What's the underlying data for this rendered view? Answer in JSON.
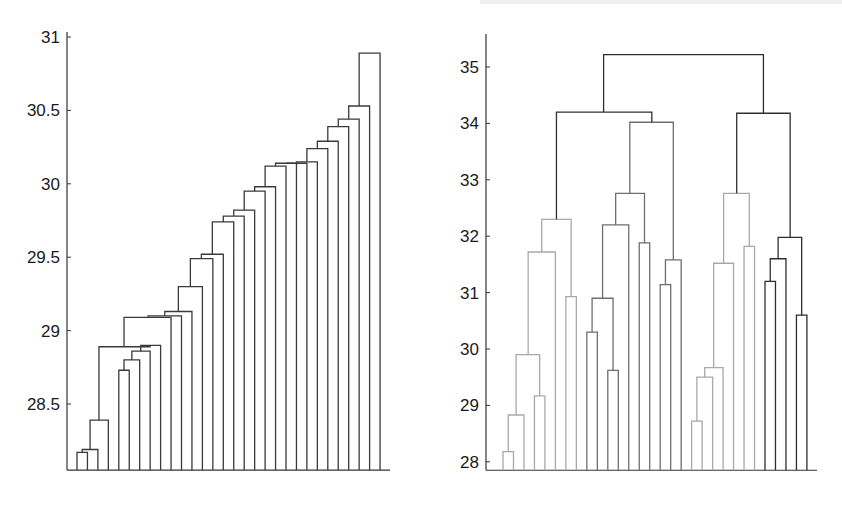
{
  "chart_data": [
    {
      "type": "dendrogram",
      "title": "",
      "xlabel": "",
      "ylabel": "",
      "ylim": [
        28.05,
        31.0
      ],
      "yticks": [
        31,
        30.5,
        30,
        29.5,
        29,
        28.5
      ],
      "ytick_labels": [
        "31",
        "30.5",
        "30",
        "29.5",
        "29",
        "28.5"
      ],
      "n_leaves": 30,
      "line_color": "#3a3a3a",
      "grid": false,
      "links": [
        {
          "x1": 0,
          "x2": 1,
          "y1": 28.05,
          "y2": 28.05,
          "h": 28.17
        },
        {
          "x1": 0.5,
          "x2": 2,
          "y1": 28.17,
          "y2": 28.05,
          "h": 28.19
        },
        {
          "x1": 1.25,
          "x2": 3,
          "y1": 28.19,
          "y2": 28.05,
          "h": 28.39
        },
        {
          "x1": 4,
          "x2": 5,
          "y1": 28.05,
          "y2": 28.05,
          "h": 28.73
        },
        {
          "x1": 4.5,
          "x2": 6,
          "y1": 28.73,
          "y2": 28.05,
          "h": 28.8
        },
        {
          "x1": 5.25,
          "x2": 7,
          "y1": 28.8,
          "y2": 28.05,
          "h": 28.86
        },
        {
          "x1": 6.1,
          "x2": 8,
          "y1": 28.86,
          "y2": 28.05,
          "h": 28.9
        },
        {
          "x1": 2.1,
          "x2": 7.0,
          "y1": 28.39,
          "y2": 28.9,
          "h": 28.89
        },
        {
          "x1": 4.5,
          "x2": 9,
          "y1": 28.89,
          "y2": 28.05,
          "h": 29.09
        },
        {
          "x1": 6.8,
          "x2": 10,
          "y1": 29.09,
          "y2": 28.05,
          "h": 29.1
        },
        {
          "x1": 8.4,
          "x2": 11,
          "y1": 29.1,
          "y2": 28.05,
          "h": 29.13
        },
        {
          "x1": 9.7,
          "x2": 12,
          "y1": 29.13,
          "y2": 28.05,
          "h": 29.3
        },
        {
          "x1": 10.85,
          "x2": 13,
          "y1": 29.3,
          "y2": 28.05,
          "h": 29.49
        },
        {
          "x1": 11.9,
          "x2": 14,
          "y1": 29.49,
          "y2": 28.05,
          "h": 29.52
        },
        {
          "x1": 12.95,
          "x2": 15,
          "y1": 29.52,
          "y2": 28.05,
          "h": 29.74
        },
        {
          "x1": 14.0,
          "x2": 16,
          "y1": 29.74,
          "y2": 28.05,
          "h": 29.78
        },
        {
          "x1": 15.0,
          "x2": 17,
          "y1": 29.78,
          "y2": 28.05,
          "h": 29.82
        },
        {
          "x1": 16.0,
          "x2": 18,
          "y1": 29.82,
          "y2": 28.05,
          "h": 29.95
        },
        {
          "x1": 17.0,
          "x2": 19,
          "y1": 29.95,
          "y2": 28.05,
          "h": 29.98
        },
        {
          "x1": 18.0,
          "x2": 20,
          "y1": 29.98,
          "y2": 28.05,
          "h": 30.12
        },
        {
          "x1": 19.0,
          "x2": 21,
          "y1": 30.12,
          "y2": 28.05,
          "h": 30.14
        },
        {
          "x1": 20.0,
          "x2": 22,
          "y1": 30.14,
          "y2": 28.05,
          "h": 30.14
        },
        {
          "x1": 21.0,
          "x2": 23,
          "y1": 30.14,
          "y2": 28.05,
          "h": 30.15
        },
        {
          "x1": 22.0,
          "x2": 24,
          "y1": 30.15,
          "y2": 28.05,
          "h": 30.24
        },
        {
          "x1": 23.0,
          "x2": 25,
          "y1": 30.24,
          "y2": 28.05,
          "h": 30.29
        },
        {
          "x1": 24.0,
          "x2": 26,
          "y1": 30.29,
          "y2": 28.05,
          "h": 30.39
        },
        {
          "x1": 25.0,
          "x2": 27,
          "y1": 30.39,
          "y2": 28.05,
          "h": 30.44
        },
        {
          "x1": 26.0,
          "x2": 28,
          "y1": 30.44,
          "y2": 28.05,
          "h": 30.53
        },
        {
          "x1": 27.0,
          "x2": 29,
          "y1": 30.53,
          "y2": 28.05,
          "h": 30.89
        }
      ]
    },
    {
      "type": "dendrogram",
      "title": "",
      "xlabel": "",
      "ylabel": "",
      "ylim": [
        27.85,
        35.55
      ],
      "yticks": [
        35,
        34,
        33,
        32,
        31,
        30,
        29,
        28
      ],
      "ytick_labels": [
        "35",
        "34",
        "33",
        "32",
        "31",
        "30",
        "29",
        "28"
      ],
      "n_leaves": 30,
      "grid": false,
      "colors": {
        "dark": "#2e2e2e",
        "mid": "#6e6e6e",
        "light": "#a8a8a8"
      },
      "links": [
        {
          "x1": 0,
          "x2": 1,
          "y1": 27.85,
          "y2": 27.85,
          "h": 28.18,
          "c": "light"
        },
        {
          "x1": 0.5,
          "x2": 2,
          "y1": 28.18,
          "y2": 27.85,
          "h": 28.83,
          "c": "light"
        },
        {
          "x1": 3,
          "x2": 4,
          "y1": 27.85,
          "y2": 27.85,
          "h": 29.17,
          "c": "light"
        },
        {
          "x1": 1.25,
          "x2": 3.5,
          "y1": 28.83,
          "y2": 29.17,
          "h": 29.9,
          "c": "light"
        },
        {
          "x1": 2.4,
          "x2": 5,
          "y1": 29.9,
          "y2": 27.85,
          "h": 31.72,
          "c": "light"
        },
        {
          "x1": 6,
          "x2": 7,
          "y1": 27.85,
          "y2": 27.85,
          "h": 30.93,
          "c": "light"
        },
        {
          "x1": 3.7,
          "x2": 6.5,
          "y1": 31.72,
          "y2": 30.93,
          "h": 32.3,
          "c": "light"
        },
        {
          "x1": 8,
          "x2": 9,
          "y1": 27.85,
          "y2": 27.85,
          "h": 30.3,
          "c": "mid"
        },
        {
          "x1": 10,
          "x2": 11,
          "y1": 27.85,
          "y2": 27.85,
          "h": 29.62,
          "c": "mid"
        },
        {
          "x1": 8.5,
          "x2": 10.5,
          "y1": 30.3,
          "y2": 29.62,
          "h": 30.9,
          "c": "mid"
        },
        {
          "x1": 9.5,
          "x2": 12,
          "y1": 30.9,
          "y2": 27.85,
          "h": 32.2,
          "c": "mid"
        },
        {
          "x1": 13,
          "x2": 14,
          "y1": 27.85,
          "y2": 27.85,
          "h": 31.88,
          "c": "mid"
        },
        {
          "x1": 10.75,
          "x2": 13.5,
          "y1": 32.2,
          "y2": 31.88,
          "h": 32.76,
          "c": "mid"
        },
        {
          "x1": 15,
          "x2": 16,
          "y1": 27.85,
          "y2": 27.85,
          "h": 31.14,
          "c": "mid"
        },
        {
          "x1": 15.5,
          "x2": 17,
          "y1": 31.14,
          "y2": 27.85,
          "h": 31.58,
          "c": "mid"
        },
        {
          "x1": 12.1,
          "x2": 16.25,
          "y1": 32.76,
          "y2": 31.58,
          "h": 34.02,
          "c": "mid"
        },
        {
          "x1": 5.1,
          "x2": 14.2,
          "y1": 32.3,
          "y2": 34.02,
          "h": 34.2,
          "c": "dark"
        },
        {
          "x1": 18,
          "x2": 19,
          "y1": 27.85,
          "y2": 27.85,
          "h": 28.72,
          "c": "light"
        },
        {
          "x1": 18.5,
          "x2": 20,
          "y1": 28.72,
          "y2": 27.85,
          "h": 29.5,
          "c": "light"
        },
        {
          "x1": 19.25,
          "x2": 21,
          "y1": 29.5,
          "y2": 27.85,
          "h": 29.67,
          "c": "light"
        },
        {
          "x1": 20.1,
          "x2": 22,
          "y1": 29.67,
          "y2": 27.85,
          "h": 31.52,
          "c": "light"
        },
        {
          "x1": 23,
          "x2": 24,
          "y1": 27.85,
          "y2": 27.85,
          "h": 31.82,
          "c": "light"
        },
        {
          "x1": 21.05,
          "x2": 23.5,
          "y1": 31.52,
          "y2": 31.82,
          "h": 32.76,
          "c": "light"
        },
        {
          "x1": 25,
          "x2": 26,
          "y1": 27.85,
          "y2": 27.85,
          "h": 31.2,
          "c": "dark"
        },
        {
          "x1": 25.5,
          "x2": 27,
          "y1": 31.2,
          "y2": 27.85,
          "h": 31.6,
          "c": "dark"
        },
        {
          "x1": 28,
          "x2": 29,
          "y1": 27.85,
          "y2": 27.85,
          "h": 30.6,
          "c": "dark"
        },
        {
          "x1": 26.25,
          "x2": 28.5,
          "y1": 31.6,
          "y2": 30.6,
          "h": 31.98,
          "c": "dark"
        },
        {
          "x1": 22.3,
          "x2": 27.4,
          "y1": 32.76,
          "y2": 31.98,
          "h": 34.18,
          "c": "dark"
        },
        {
          "x1": 9.6,
          "x2": 24.85,
          "y1": 34.2,
          "y2": 34.18,
          "h": 35.22,
          "c": "dark"
        }
      ]
    }
  ]
}
